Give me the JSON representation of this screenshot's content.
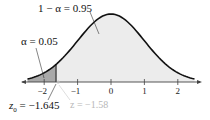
{
  "chart_data": {
    "type": "area",
    "title": "",
    "xlabel": "",
    "ylabel": "",
    "distribution": "standard normal",
    "x_ticks": [
      -2,
      -1,
      0,
      1,
      2
    ],
    "x_tick_labels": [
      "−2",
      "−1",
      "0",
      "1",
      "2"
    ],
    "xlim": [
      -2.5,
      2.5
    ],
    "grid": false,
    "legend": "none",
    "shaded_regions": [
      {
        "name": "rejection region",
        "from": -2.5,
        "to": -1.645,
        "area": 0.05,
        "color": "#a9a9a9"
      },
      {
        "name": "non-rejection region",
        "from": -1.645,
        "to": 2.5,
        "area": 0.95,
        "color": "#ececec"
      }
    ],
    "critical_value": -1.645,
    "test_statistic": -1.58,
    "annotations": [
      {
        "text": "1 − α = 0.95",
        "points_to": "non-rejection region"
      },
      {
        "text": "α = 0.05",
        "points_to": "rejection region"
      },
      {
        "text": "z₀ = −1.645",
        "points_to": "critical value"
      },
      {
        "text": "z = −1.58",
        "points_to": "test statistic"
      }
    ]
  },
  "labels": {
    "confidence": "1 − α = 0.95",
    "alpha": "α = 0.05",
    "z0_prefix": "z",
    "z0_sub": "0",
    "z0_value": " = −1.645",
    "z_stat": "z = −1.58"
  },
  "colors": {
    "curve": "#111111",
    "tail_fill": "#a9a9a9",
    "body_fill": "#ececec",
    "axis": "#444444",
    "stat_label": "#b8b8b8"
  }
}
